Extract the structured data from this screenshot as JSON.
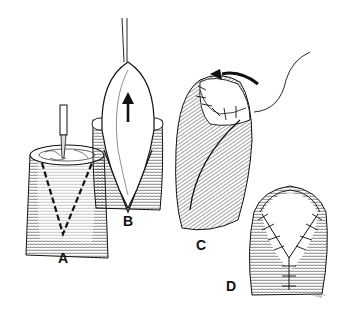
{
  "figure": {
    "panels": [
      {
        "id": "A",
        "label": "A",
        "label_pos": [
          58,
          251
        ]
      },
      {
        "id": "B",
        "label": "B",
        "label_pos": [
          123,
          214
        ]
      },
      {
        "id": "C",
        "label": "C",
        "label_pos": [
          196,
          238
        ]
      },
      {
        "id": "D",
        "label": "D",
        "label_pos": [
          226,
          279
        ]
      }
    ],
    "signature": "~sig~",
    "colors": {
      "ink": "#111111",
      "background": "#ffffff",
      "hatch": "#333333"
    }
  }
}
